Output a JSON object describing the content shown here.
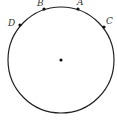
{
  "diagram": {
    "type": "circle-with-points",
    "circle": {
      "cx": 61,
      "cy": 60,
      "r": 53,
      "stroke": "#222222"
    },
    "center": {
      "x": 61,
      "y": 60
    },
    "points": [
      {
        "label": "B",
        "x": 44,
        "y": 9,
        "lx": 37,
        "ly": 6
      },
      {
        "label": "A",
        "x": 78,
        "y": 9,
        "lx": 77,
        "ly": 5
      },
      {
        "label": "D",
        "x": 20,
        "y": 25,
        "lx": 8,
        "ly": 25
      },
      {
        "label": "C",
        "x": 104,
        "y": 27,
        "lx": 106,
        "ly": 23
      }
    ]
  }
}
